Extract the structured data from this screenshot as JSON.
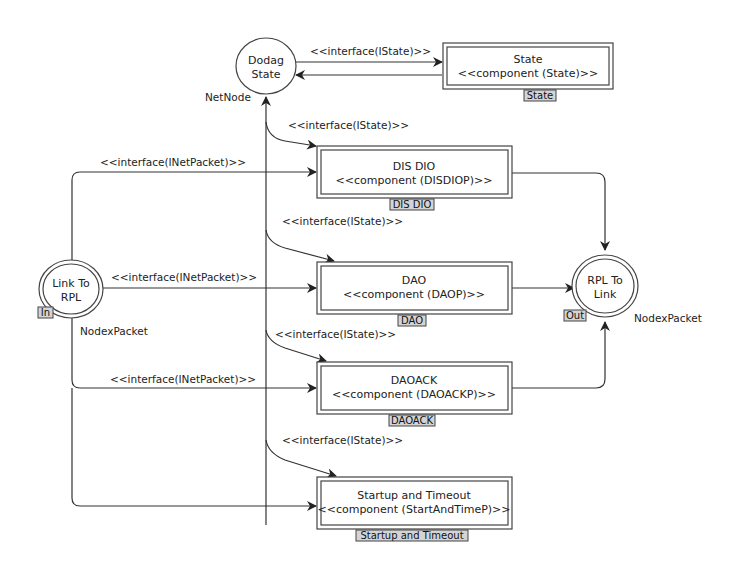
{
  "diagram": {
    "places": {
      "dodag_state": {
        "line1": "Dodag",
        "line2": "State",
        "type_label": "NetNode"
      },
      "link_to_rpl": {
        "line1": "Link To",
        "line2": "RPL",
        "port_tag": "In",
        "type_label": "NodexPacket"
      },
      "rpl_to_link": {
        "line1": "RPL To",
        "line2": "Link",
        "port_tag": "Out",
        "type_label": "NodexPacket"
      }
    },
    "transitions": {
      "state": {
        "name": "State",
        "component": "<<component (State)>>",
        "tag": "State"
      },
      "dis_dio": {
        "name": "DIS DIO",
        "component": "<<component (DISDIOP)>>",
        "tag": "DIS DIO"
      },
      "dao": {
        "name": "DAO",
        "component": "<<component (DAOP)>>",
        "tag": "DAO"
      },
      "daoack": {
        "name": "DAOACK",
        "component": "<<component (DAOACKP)>>",
        "tag": "DAOACK"
      },
      "startup": {
        "name": "Startup and Timeout",
        "component": "<<component (StartAndTimeP)>>",
        "tag": "Startup and Timeout"
      }
    },
    "edge_labels": {
      "dodag_to_state": "<<interface(IState)>>",
      "dodag_to_disdio": "<<interface(IState)>>",
      "dodag_to_dao": "<<interface(IState)>>",
      "dodag_to_daoack": "<<interface(IState)>>",
      "dodag_to_startup": "<<interface(IState)>>",
      "link_to_disdio": "<<interface(INetPacket)>>",
      "link_to_dao": "<<interface(INetPacket)>>",
      "link_to_daoack": "<<interface(INetPacket)>>"
    }
  }
}
